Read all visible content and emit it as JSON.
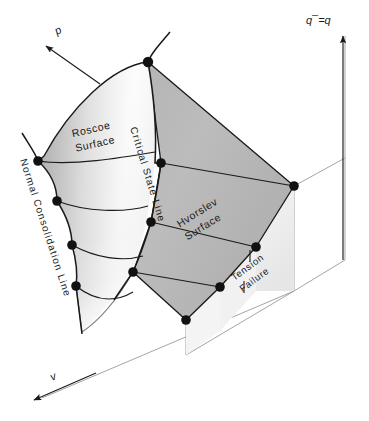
{
  "figure": {
    "background_color": "#ffffff",
    "stroke_color": "#1a1a1a",
    "node_color": "#111111",
    "hvorslev_fill": "#b9b9b9",
    "roscoe_fill_light": "#fdfdfd",
    "roscoe_fill_shade": "#c9c9c9",
    "tension_fill": "#efefef",
    "axis_frame_color": "#8a8a8a"
  },
  "axes": [
    {
      "id": "q",
      "label": "q¯=q",
      "direction": "up",
      "tip": {
        "x": 343,
        "y": 30
      }
    },
    {
      "id": "p",
      "label": "p",
      "direction": "up-left",
      "tip": {
        "x": 42,
        "y": 42
      }
    },
    {
      "id": "v",
      "label": "v",
      "direction": "down-left",
      "tip": {
        "x": 32,
        "y": 402
      }
    }
  ],
  "surfaces": [
    {
      "id": "roscoe",
      "label_lines": [
        "Roscoe",
        "Surface"
      ],
      "rotation": -13
    },
    {
      "id": "hvorslev",
      "label_lines": [
        "Hvorslev",
        "Surface"
      ],
      "rotation": -30
    },
    {
      "id": "tension",
      "label_lines": [
        "Tension",
        "Failure"
      ],
      "rotation": -35
    }
  ],
  "lines": [
    {
      "id": "critical-state-line",
      "label": "Critical State Line"
    },
    {
      "id": "normal-consolidation-line",
      "label": "Normal Consolidation Line"
    }
  ],
  "nodes": [
    {
      "id": "apex",
      "x": 148,
      "y": 62
    },
    {
      "id": "ncl-1",
      "x": 38,
      "y": 161
    },
    {
      "id": "ncl-2",
      "x": 57,
      "y": 201
    },
    {
      "id": "ncl-3",
      "x": 72,
      "y": 245
    },
    {
      "id": "ncl-4",
      "x": 76,
      "y": 286
    },
    {
      "id": "csl-1",
      "x": 161,
      "y": 163
    },
    {
      "id": "csl-2",
      "x": 151,
      "y": 222
    },
    {
      "id": "csl-3",
      "x": 133,
      "y": 272
    },
    {
      "id": "hv-right-1",
      "x": 294,
      "y": 186
    },
    {
      "id": "hv-right-2",
      "x": 256,
      "y": 247
    },
    {
      "id": "hv-right-3",
      "x": 220,
      "y": 287
    },
    {
      "id": "hv-right-4",
      "x": 186,
      "y": 320
    }
  ]
}
